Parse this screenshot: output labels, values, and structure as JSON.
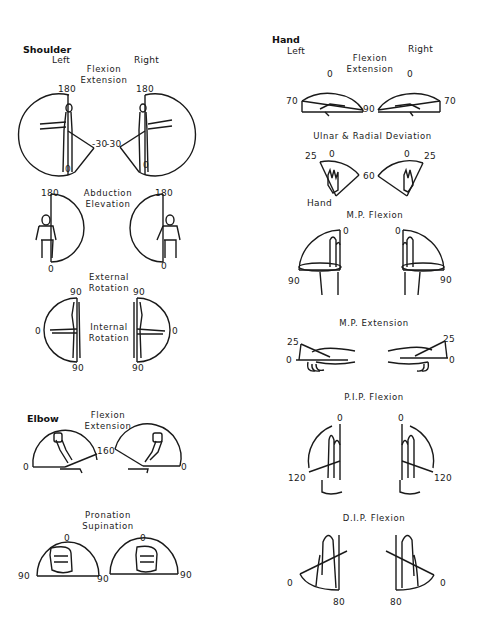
{
  "sections": {
    "shoulder": {
      "title": "Shoulder",
      "left_label": "Left",
      "right_label": "Right",
      "flexion_extension": {
        "caption_line1": "Flexion",
        "caption_line2": "Extension",
        "left": {
          "top": "180",
          "bottom": "0",
          "ext": "-30"
        },
        "right": {
          "top": "180",
          "bottom": "0",
          "ext": "-30"
        }
      },
      "abduction_elevation": {
        "caption_line1": "Abduction",
        "caption_line2": "Elevation",
        "left": {
          "top": "180",
          "bottom": "0"
        },
        "right": {
          "top": "180",
          "bottom": "0"
        }
      },
      "rotation": {
        "caption_top_line1": "External",
        "caption_top_line2": "Rotation",
        "caption_mid_line1": "Internal",
        "caption_mid_line2": "Rotation",
        "left": {
          "top": "90",
          "side": "0",
          "bottom": "90"
        },
        "right": {
          "top": "90",
          "side": "0",
          "bottom": "90"
        }
      }
    },
    "elbow": {
      "title": "Elbow",
      "flexion_extension": {
        "caption_line1": "Flexion",
        "caption_line2": "Extension",
        "left": {
          "start": "0",
          "end": "160"
        },
        "right": {
          "end": "0"
        }
      },
      "pronation_supination": {
        "caption_line1": "Pronation",
        "caption_line2": "Supination",
        "left": {
          "top": "0",
          "left": "90",
          "right": "90"
        },
        "right": {
          "top": "0",
          "right": "90"
        }
      }
    },
    "hand": {
      "title": "Hand",
      "left_label": "Left",
      "right_label": "Right",
      "flexion_extension": {
        "caption_line1": "Flexion",
        "caption_line2": "Extension",
        "left": {
          "top": "0",
          "side": "70",
          "bottom": "90"
        },
        "right": {
          "top": "0",
          "side": "70"
        }
      },
      "ulnar_radial": {
        "caption": "Ulnar & Radial Deviation",
        "left": {
          "outer": "25",
          "top": "0",
          "inner": "60",
          "below": "Hand"
        },
        "right": {
          "top": "0",
          "outer": "25"
        }
      },
      "mp_flexion": {
        "caption": "M.P. Flexion",
        "left": {
          "top": "0",
          "side": "90"
        },
        "right": {
          "top": "0",
          "side": "90"
        }
      },
      "mp_extension": {
        "caption": "M.P. Extension",
        "left": {
          "top": "25",
          "base": "0"
        },
        "right": {
          "top": "25",
          "base": "0"
        }
      },
      "pip_flexion": {
        "caption": "P.I.P. Flexion",
        "left": {
          "top": "0",
          "bottom": "120"
        },
        "right": {
          "top": "0",
          "bottom": "120"
        }
      },
      "dip_flexion": {
        "caption": "D.I.P. Flexion",
        "left": {
          "side": "0",
          "bottom": "80"
        },
        "right": {
          "side": "0",
          "bottom": "80"
        }
      }
    }
  }
}
